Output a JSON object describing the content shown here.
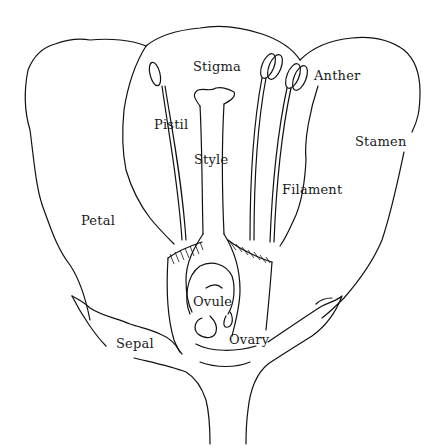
{
  "diagram": {
    "labels": {
      "stigma": "Stigma",
      "pistil": "Pistil",
      "style": "Style",
      "anther": "Anther",
      "stamen": "Stamen",
      "filament": "Filament",
      "petal": "Petal",
      "ovule": "Ovule",
      "ovary": "Ovary",
      "sepal": "Sepal"
    },
    "colors": {
      "line": "#111111",
      "text": "#1a1a1a",
      "background": "#ffffff"
    }
  }
}
